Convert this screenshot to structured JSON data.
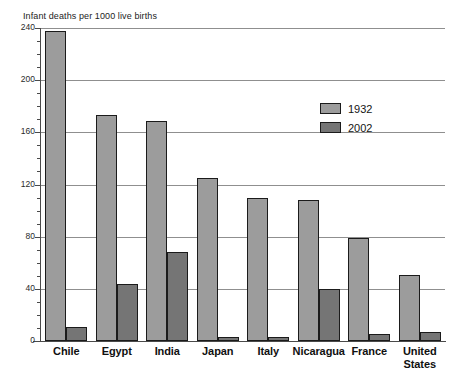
{
  "chart_data": {
    "type": "bar",
    "title": "Infant deaths per 1000 live births",
    "xlabel": "",
    "ylabel": "",
    "ylim": [
      0,
      240
    ],
    "yticks": [
      0,
      40,
      80,
      120,
      160,
      200,
      240
    ],
    "ytick_labels": [
      "0",
      "40",
      "80",
      "120",
      "160",
      "200",
      "240"
    ],
    "minor_tick_step": 10,
    "grid": true,
    "legend_position": "inside-upper-right",
    "categories": [
      "Chile",
      "Egypt",
      "India",
      "Japan",
      "Italy",
      "Nicaragua",
      "France",
      "United States"
    ],
    "series": [
      {
        "name": "1932",
        "color": "#9c9c9c",
        "values": [
          238,
          173,
          169,
          125,
          110,
          108,
          79,
          51
        ]
      },
      {
        "name": "2002",
        "color": "#757575",
        "values": [
          11,
          44,
          68,
          3,
          3,
          40,
          5,
          7
        ]
      }
    ]
  },
  "legend": {
    "items": [
      {
        "label": "1932",
        "swatch": "legend-swatch-1932"
      },
      {
        "label": "2002",
        "swatch": "legend-swatch-2002"
      }
    ]
  },
  "axis": {
    "left_axis_name": "y-axis-line",
    "bottom_axis_name": "x-axis-line"
  }
}
